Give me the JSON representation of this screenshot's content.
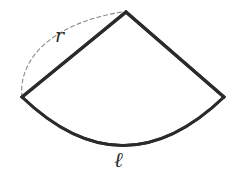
{
  "figure": {
    "name": "circular-sector-diagram",
    "background_color": "#ffffff",
    "stroke_color": "#2b2b2b",
    "dashed_stroke_color": "#8a8a8a",
    "labels": {
      "radius": "r",
      "arc_length": "ℓ"
    },
    "geometry": {
      "apex": {
        "x": 126,
        "y": 12
      },
      "left_vertex": {
        "x": 22,
        "y": 97
      },
      "right_vertex": {
        "x": 224,
        "y": 97
      },
      "arc_bottom": {
        "x": 123,
        "y": 145
      },
      "radius_line_stroke_width": 3.2,
      "arc_stroke_width": 2.6,
      "dashed_arc_stroke_width": 1.1,
      "dash_pattern": "4,3"
    }
  }
}
